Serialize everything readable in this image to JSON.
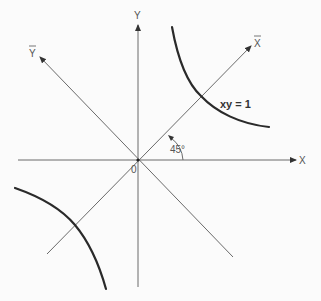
{
  "diagram": {
    "axes": {
      "x_label": "X",
      "y_label": "Y",
      "x_bar_label": "X",
      "y_bar_label": "Y",
      "origin_label": "0"
    },
    "angle_label": "45°",
    "curve_label": "xy = 1",
    "colors": {
      "axis": "#6a6a6a",
      "curve": "#2a2a2a",
      "background": "#fbfbfb"
    }
  }
}
